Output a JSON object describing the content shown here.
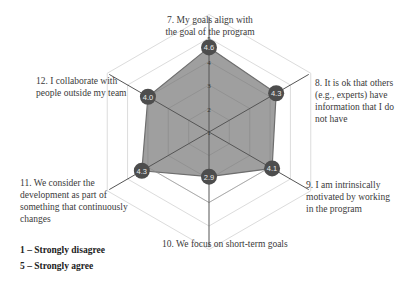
{
  "chart_data": {
    "type": "radar",
    "title": "",
    "categories": [
      "7. My goals align with the goal of the program",
      "8. It is ok that others (e.g., experts) have information that I do not have",
      "9. I am intrinsically motivated by working in the program",
      "10. We focus on short-term goals",
      "11. We consider the development as part of something that continuously changes",
      "12. I collaborate with people outside my team"
    ],
    "series": [
      {
        "name": "Mean score",
        "values": [
          4.6,
          4.3,
          4.1,
          2.9,
          4.3,
          4.0
        ]
      }
    ],
    "value_labels": [
      "4.6",
      "4.3",
      "4.1",
      "2.9",
      "4.3",
      "4.0"
    ],
    "radial_ticks": [
      "1",
      "2",
      "3",
      "4",
      "5"
    ],
    "rlim": [
      1,
      5
    ],
    "grid": true,
    "legend_position": "none"
  },
  "labels": {
    "q7_line1": "7. My goals align with",
    "q7_line2": "the goal of the program",
    "q8_line1": "8. It is ok that others",
    "q8_line2": "(e.g., experts) have",
    "q8_line3": "information that I do",
    "q8_line4": "not have",
    "q9_line1": "9. I am intrinsically",
    "q9_line2": "motivated by working",
    "q9_line3": "in the program",
    "q10_line1": "10. We focus on short-term goals",
    "q11_line1": "11. We consider the",
    "q11_line2": "development as part of",
    "q11_line3": "something that continuously",
    "q11_line4": "changes",
    "q12_line1": "12. I collaborate with",
    "q12_line2": "people outside my team"
  },
  "scale_legend": {
    "low": "1 – Strongly disagree",
    "high": "5 – Strongly agree"
  },
  "colors": {
    "fill": "#9a9a9a",
    "outline": "#6e6e6e",
    "marker": "#4d4d4d",
    "grid": "#dcdcdc",
    "spoke": "#555555"
  }
}
